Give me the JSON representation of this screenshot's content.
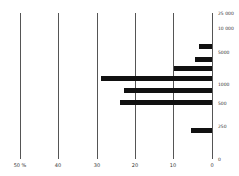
{
  "chart_data": {
    "type": "bar",
    "orientation": "horizontal",
    "title": "",
    "xlabel": "",
    "ylabel": "",
    "x_axis": {
      "direction": "right-to-left",
      "ticks": [
        "50 %",
        "40",
        "30",
        "20",
        "10",
        "0"
      ],
      "range": [
        0,
        50
      ],
      "unit": "%"
    },
    "y_axis": {
      "position": "right",
      "scale": "log-like",
      "ticks": [
        "25 000",
        "10 000",
        "5000",
        "1000",
        "500",
        "250",
        "0"
      ]
    },
    "grid": true,
    "legend": null,
    "bars": [
      {
        "y_position": "between 10 000 and 5000",
        "value": 3.4
      },
      {
        "y_position": "just below 5000",
        "value": 4.4
      },
      {
        "y_position": "between 5000 and 1000",
        "value": 10
      },
      {
        "y_position": "just above 1000",
        "value": 29
      },
      {
        "y_position": "between 1000 and 500",
        "value": 23
      },
      {
        "y_position": "at 500",
        "value": 24
      },
      {
        "y_position": "just below 250",
        "value": 5.5
      }
    ],
    "values": [
      3.4,
      4.4,
      10,
      29,
      23,
      24,
      5.5
    ]
  },
  "axis": {
    "x_ticks": [
      {
        "label": "50 %",
        "x": 20
      },
      {
        "label": "40",
        "x": 58
      },
      {
        "label": "30",
        "x": 97
      },
      {
        "label": "20",
        "x": 135
      },
      {
        "label": "10",
        "x": 173
      },
      {
        "label": "0",
        "x": 212
      }
    ],
    "y_ticks": [
      {
        "label": "25 000",
        "y": 13
      },
      {
        "label": "10 000",
        "y": 28
      },
      {
        "label": "5000",
        "y": 52
      },
      {
        "label": "1000",
        "y": 84
      },
      {
        "label": "500",
        "y": 103
      },
      {
        "label": "250",
        "y": 126
      },
      {
        "label": "0",
        "y": 159
      }
    ]
  },
  "bars_layout": [
    {
      "y": 46,
      "value": 3.4
    },
    {
      "y": 59,
      "value": 4.4
    },
    {
      "y": 68,
      "value": 10
    },
    {
      "y": 78,
      "value": 29
    },
    {
      "y": 90,
      "value": 23
    },
    {
      "y": 102,
      "value": 24
    },
    {
      "y": 130,
      "value": 5.5
    }
  ]
}
